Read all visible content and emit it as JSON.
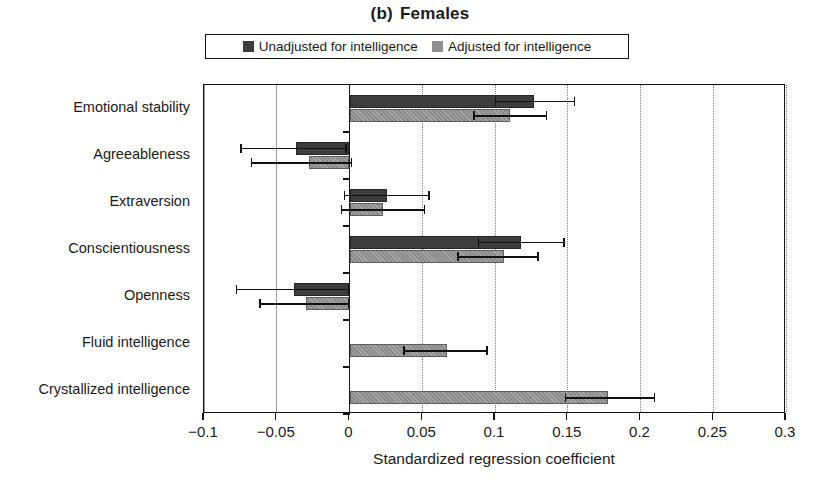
{
  "title": {
    "panel": "(b)",
    "text": "Females"
  },
  "legend": {
    "items": [
      {
        "label": "Unadjusted for intelligence",
        "color": "#3d3d3d",
        "key": "unadjusted"
      },
      {
        "label": "Adjusted for intelligence",
        "color": "#8b8b8b",
        "key": "adjusted"
      }
    ]
  },
  "axes": {
    "xlabel": "Standardized regression coefficient",
    "xticks": [
      -0.1,
      -0.05,
      0,
      0.05,
      0.1,
      0.15,
      0.2,
      0.25,
      0.3
    ],
    "xticklabels": [
      "−0.1",
      "−0.05",
      "0",
      "0.05",
      "0.1",
      "0.15",
      "0.2",
      "0.25",
      "0.3"
    ],
    "xlim": [
      -0.1,
      0.3
    ],
    "grid": "vertical-dotted"
  },
  "chart_data": {
    "type": "bar",
    "orientation": "horizontal",
    "xlabel": "Standardized regression coefficient",
    "ylabel": "",
    "xlim": [
      -0.1,
      0.3
    ],
    "xticks": [
      -0.1,
      -0.05,
      0,
      0.05,
      0.1,
      0.15,
      0.2,
      0.25,
      0.3
    ],
    "grid": true,
    "legend_position": "top",
    "categories": [
      "Emotional stability",
      "Agreeableness",
      "Extraversion",
      "Conscientiousness",
      "Openness",
      "Fluid intelligence",
      "Crystallized intelligence"
    ],
    "series": [
      {
        "name": "Unadjusted for intelligence",
        "color": "#3d3d3d",
        "values": [
          0.127,
          -0.037,
          0.026,
          0.118,
          -0.038,
          null,
          null
        ],
        "ci_low": [
          0.1,
          -0.075,
          -0.004,
          0.088,
          -0.078,
          null,
          null
        ],
        "ci_high": [
          0.155,
          -0.002,
          0.055,
          0.148,
          0.0,
          null,
          null
        ]
      },
      {
        "name": "Adjusted for intelligence",
        "color": "#8b8b8b",
        "values": [
          0.11,
          -0.028,
          0.023,
          0.106,
          -0.03,
          0.067,
          0.178
        ],
        "ci_low": [
          0.085,
          -0.068,
          -0.006,
          0.074,
          -0.062,
          0.037,
          0.148
        ],
        "ci_high": [
          0.136,
          0.002,
          0.052,
          0.13,
          0.0,
          0.095,
          0.21
        ]
      }
    ]
  }
}
